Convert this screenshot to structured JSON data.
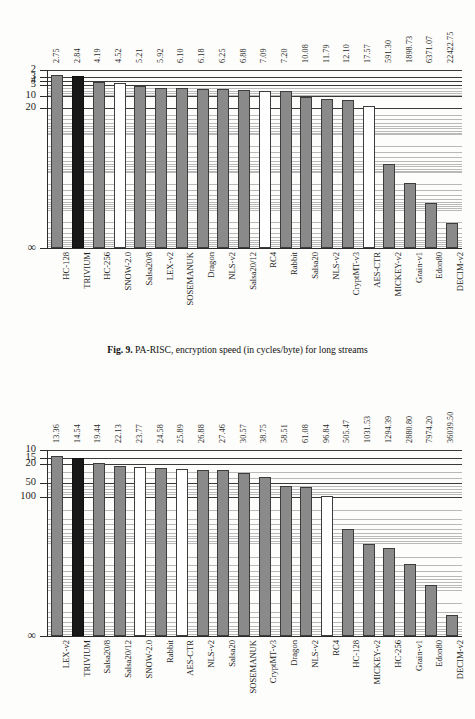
{
  "page": {
    "background": "#fdfdfb",
    "ink": "#1c1c1c"
  },
  "colors": {
    "gray_bar": "#8a8a8a",
    "black_bar": "#181818",
    "white_bar": "#ffffff",
    "bar_outline": "#3d3d3d",
    "gridline_major": "#3a3a3a",
    "gridline_minor": "#b9b9b9",
    "axis": "#2b2b2b"
  },
  "figures": [
    {
      "id": "fig-top",
      "caption_prefix": "Fig. 9.",
      "caption_text": "PA-RISC, encryption speed (in cycles/byte) for long streams",
      "chart_data": {
        "type": "bar",
        "title": "Fig. 9. PA-RISC, encryption speed (in cycles/byte) for long streams",
        "xlabel": "",
        "ylabel": "cycles/byte",
        "scale": "log-inverted",
        "ylim": [
          2,
          100000
        ],
        "grid": true,
        "legend": "none",
        "ytick_labels": [
          "2",
          "3",
          "4",
          "5",
          "10",
          "20",
          "∞"
        ],
        "ytick_values": [
          2,
          3,
          4,
          5,
          10,
          20,
          100000
        ],
        "categories": [
          "HC-128",
          "TRIVIUM",
          "HC-256",
          "SNOW-2.0",
          "Salsa20/8",
          "LEX-v2",
          "SOSEMANUK",
          "Dragon",
          "NLS-v2",
          "Salsa20/12",
          "RC4",
          "Rabbit",
          "Salsa20",
          "NLS-v2",
          "CryptMT-v3",
          "AES-CTR",
          "MICKEY-v2",
          "Grain-v1",
          "Edon80",
          "DECIM-v2"
        ],
        "values": [
          2.75,
          2.84,
          4.19,
          4.52,
          5.21,
          5.92,
          6.1,
          6.18,
          6.25,
          6.88,
          7.09,
          7.2,
          10.08,
          11.79,
          12.1,
          17.57,
          591.3,
          1898.73,
          6371.07,
          22422.75
        ],
        "value_labels": [
          "2.75",
          "2.84",
          "4.19",
          "4.52",
          "5.21",
          "5.92",
          "6.10",
          "6.18",
          "6.25",
          "6.88",
          "7.09",
          "7.20",
          "10.08",
          "11.79",
          "12.10",
          "17.57",
          "591.30",
          "1898.73",
          "6371.07",
          "22422.75"
        ],
        "bar_styles": [
          "gray",
          "black",
          "gray",
          "white",
          "gray",
          "gray",
          "gray",
          "gray",
          "gray",
          "gray",
          "white",
          "gray",
          "gray",
          "gray",
          "gray",
          "white",
          "gray",
          "gray",
          "gray",
          "gray"
        ]
      }
    },
    {
      "id": "fig-bottom",
      "caption_prefix": "",
      "caption_text": "",
      "chart_data": {
        "type": "bar",
        "title": "",
        "xlabel": "",
        "ylabel": "cycles/byte",
        "scale": "log-inverted",
        "ylim": [
          10,
          100000
        ],
        "grid": true,
        "legend": "none",
        "ytick_labels": [
          "10",
          "15",
          "20",
          "50",
          "100",
          "∞"
        ],
        "ytick_values": [
          10,
          15,
          20,
          50,
          100,
          100000
        ],
        "categories": [
          "LEX-v2",
          "TRIVIUM",
          "Salsa20/8",
          "Salsa20/12",
          "SNOW-2.0",
          "Rabbit",
          "AES-CTR",
          "NLS-v2",
          "Salsa20",
          "SOSEMANUK",
          "CryptMT-v3",
          "Dragon",
          "NLS-v2",
          "RC4",
          "HC-128",
          "MICKEY-v2",
          "HC-256",
          "Grain-v1",
          "Edon80",
          "DECIM-v2"
        ],
        "values": [
          13.36,
          14.54,
          19.44,
          22.13,
          23.77,
          24.58,
          25.89,
          26.88,
          27.46,
          30.57,
          38.75,
          58.51,
          61.08,
          96.84,
          505.47,
          1031.53,
          1294.39,
          2880.8,
          7974.2,
          36039.5
        ],
        "value_labels": [
          "13.36",
          "14.54",
          "19.44",
          "22.13",
          "23.77",
          "24.58",
          "25.89",
          "26.88",
          "27.46",
          "30.57",
          "38.75",
          "58.51",
          "61.08",
          "96.84",
          "505.47",
          "1031.53",
          "1294.39",
          "2880.80",
          "7974.20",
          "36039.50"
        ],
        "bar_styles": [
          "gray",
          "black",
          "gray",
          "gray",
          "white",
          "gray",
          "white",
          "gray",
          "gray",
          "gray",
          "gray",
          "gray",
          "gray",
          "white",
          "gray",
          "gray",
          "gray",
          "gray",
          "gray",
          "gray"
        ]
      }
    }
  ]
}
